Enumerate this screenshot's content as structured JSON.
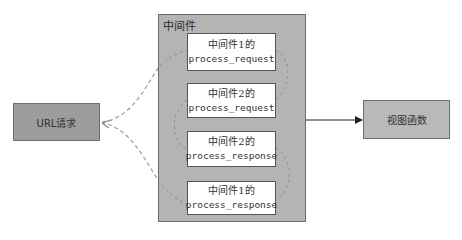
{
  "diagram": {
    "container": {
      "title": "中间件",
      "fill": "#b4b4b4"
    },
    "steps": [
      {
        "label_cn": "中间件1的",
        "label_code": "process_request"
      },
      {
        "label_cn": "中间件2的",
        "label_code": "process_request"
      },
      {
        "label_cn": "中间件2的",
        "label_code": "process_response"
      },
      {
        "label_cn": "中间件1的",
        "label_code": "process_response"
      }
    ],
    "request_node": {
      "label": "URL请求",
      "fill": "#9c9c9c"
    },
    "view_node": {
      "label": "视图函数",
      "fill": "#b9b9b9"
    },
    "edges": [
      {
        "from": "URL请求",
        "to": "中间件1的 process_request",
        "style": "dashed"
      },
      {
        "from": "中间件1的 process_request",
        "to": "中间件2的 process_request",
        "style": "dashed"
      },
      {
        "from": "中间件",
        "to": "视图函数",
        "style": "solid-arrow"
      },
      {
        "from": "中间件2的 process_response",
        "to": "中间件1的 process_response",
        "style": "dashed"
      },
      {
        "from": "中间件1的 process_response",
        "to": "URL请求",
        "style": "dashed-arrow"
      }
    ]
  }
}
